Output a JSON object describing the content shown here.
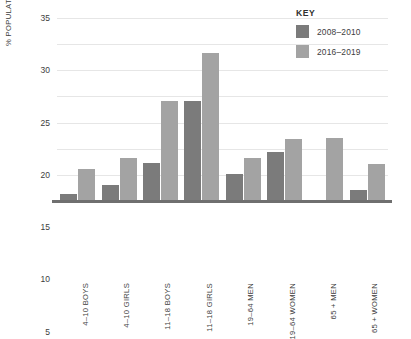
{
  "chart_data": {
    "type": "bar",
    "title": "",
    "xlabel": "",
    "ylabel": "% POPULATION BELOW THE LRNI",
    "ylim": [
      0,
      35
    ],
    "yticks": [
      5,
      10,
      15,
      20,
      25,
      30,
      35
    ],
    "grid": true,
    "legend_position": "top-right",
    "legend_title": "KEY",
    "categories": [
      "4–10 BOYS",
      "4–10 GIRLS",
      "11–18 BOYS",
      "11–18 GIRLS",
      "19–64 MEN",
      "19–64 WOMEN",
      "65 + MEN",
      "65 + WOMEN"
    ],
    "series": [
      {
        "name": "2008–2010",
        "color": "#7b7b7b",
        "values": [
          1.3,
          3.0,
          7.3,
          19.2,
          5.2,
          9.4,
          0,
          2.1
        ]
      },
      {
        "name": "2016–2019",
        "color": "#a3a3a3",
        "values": [
          6.1,
          8.3,
          19.2,
          28.4,
          8.3,
          11.9,
          12.0,
          7.0
        ]
      }
    ]
  },
  "colors": {
    "series_dark": "#7b7b7b",
    "series_light": "#a3a3a3",
    "gridline": "#e6e6e6",
    "axis": "#6f6f6f",
    "text": "#3d3d3d",
    "background": "#ffffff"
  }
}
